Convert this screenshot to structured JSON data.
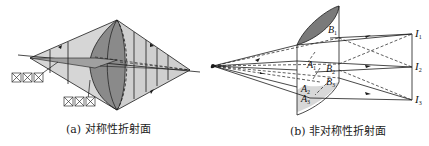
{
  "figure": {
    "panels": [
      {
        "id": "a",
        "caption": "(a) 对称性折射面",
        "description": "Symmetric refracting surface: rays from a point source converge through a symmetric lens to a single focal point; three sets of sagittal/tangential marker boxes shown",
        "marker_boxes": [
          "☒",
          "☒",
          "☒"
        ]
      },
      {
        "id": "b",
        "caption": "(b) 非对称性折射面",
        "description": "Asymmetric refracting surface: rays from a point source pass through an asymmetric surface and focus to three separate image points",
        "points": {
          "A1": "A",
          "A1_sub": "1",
          "A2": "A",
          "A2_sub": "2",
          "A3": "A",
          "A3_sub": "3",
          "B1": "B",
          "B1_sub": "1",
          "B2": "B",
          "B2_sub": "2",
          "B3": "B",
          "B3_sub": "3"
        },
        "images": {
          "I1": "I",
          "I1_sub": "1",
          "I2": "I",
          "I2_sub": "2",
          "I3": "I",
          "I3_sub": "3"
        }
      }
    ],
    "colors": {
      "line": "#1a1a1a",
      "lens_dark": "#7a7a7a",
      "lens_mid": "#a8a8a8",
      "cone_light": "#cfcfcf",
      "lens_light": "#dcdcdc"
    }
  }
}
